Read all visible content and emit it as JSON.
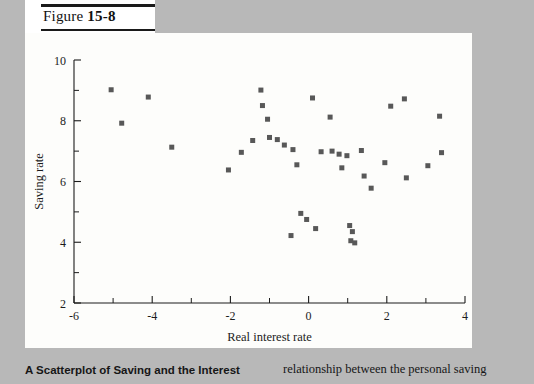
{
  "figure": {
    "label_prefix": "Figure ",
    "label_number": "15-8"
  },
  "caption": {
    "left_text": "A Scatterplot of Saving and the Interest",
    "right_text": "relationship between the personal saving"
  },
  "chart_data": {
    "type": "scatter",
    "title": "",
    "xlabel": "Real interest rate",
    "ylabel": "Saving rate",
    "xlim": [
      -6,
      4
    ],
    "ylim": [
      2,
      10
    ],
    "xticks": [
      -6,
      -4,
      -2,
      0,
      2,
      4
    ],
    "xticklabels": [
      "-6",
      "-4",
      "-2",
      "0",
      "2",
      "4"
    ],
    "yticks": [
      2,
      4,
      6,
      8,
      10
    ],
    "yticklabels": [
      "2",
      "4",
      "6",
      "8",
      "10"
    ],
    "x_minor_ticks": [
      -5,
      -3,
      -1,
      1,
      3
    ],
    "y_minor_ticks": [
      3,
      5,
      7,
      9
    ],
    "grid": false,
    "legend": null,
    "marker": "square",
    "marker_color": "#585858",
    "marker_size_px": 5,
    "points": [
      {
        "x": -5.05,
        "y": 9.02
      },
      {
        "x": -4.1,
        "y": 8.78
      },
      {
        "x": -4.78,
        "y": 7.92
      },
      {
        "x": -3.5,
        "y": 7.13
      },
      {
        "x": -2.05,
        "y": 6.38
      },
      {
        "x": -1.72,
        "y": 6.96
      },
      {
        "x": -1.43,
        "y": 7.35
      },
      {
        "x": -1.22,
        "y": 9.01
      },
      {
        "x": -1.18,
        "y": 8.5
      },
      {
        "x": -1.05,
        "y": 8.05
      },
      {
        "x": -1.0,
        "y": 7.45
      },
      {
        "x": -0.8,
        "y": 7.38
      },
      {
        "x": -0.62,
        "y": 7.2
      },
      {
        "x": -0.4,
        "y": 7.05
      },
      {
        "x": -0.3,
        "y": 6.55
      },
      {
        "x": -0.2,
        "y": 4.95
      },
      {
        "x": -0.05,
        "y": 4.75
      },
      {
        "x": -0.45,
        "y": 4.22
      },
      {
        "x": 0.18,
        "y": 4.45
      },
      {
        "x": 0.32,
        "y": 6.98
      },
      {
        "x": 0.1,
        "y": 8.75
      },
      {
        "x": 0.55,
        "y": 8.12
      },
      {
        "x": 0.6,
        "y": 7.0
      },
      {
        "x": 0.78,
        "y": 6.9
      },
      {
        "x": 0.85,
        "y": 6.45
      },
      {
        "x": 0.98,
        "y": 6.85
      },
      {
        "x": 1.05,
        "y": 4.55
      },
      {
        "x": 1.12,
        "y": 4.35
      },
      {
        "x": 1.08,
        "y": 4.05
      },
      {
        "x": 1.18,
        "y": 3.98
      },
      {
        "x": 1.35,
        "y": 7.02
      },
      {
        "x": 1.42,
        "y": 6.18
      },
      {
        "x": 1.6,
        "y": 5.78
      },
      {
        "x": 1.95,
        "y": 6.62
      },
      {
        "x": 2.1,
        "y": 8.48
      },
      {
        "x": 2.45,
        "y": 8.72
      },
      {
        "x": 2.5,
        "y": 6.12
      },
      {
        "x": 3.05,
        "y": 6.52
      },
      {
        "x": 3.35,
        "y": 8.15
      },
      {
        "x": 3.4,
        "y": 6.95
      }
    ]
  }
}
